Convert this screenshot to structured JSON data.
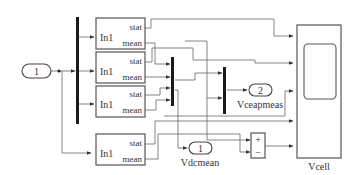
{
  "diagram": {
    "type": "simulink-block-diagram",
    "inport": {
      "number": "1"
    },
    "stat_blocks": [
      {
        "input": "In1",
        "out1": "stat",
        "out2": "mean"
      },
      {
        "input": "In1",
        "out1": "stat",
        "out2": "mean"
      },
      {
        "input": "In1",
        "out1": "stat",
        "out2": "mean"
      },
      {
        "input": "In1",
        "out1": "stat",
        "out2": "mean"
      }
    ],
    "outport_vcap": {
      "number": "2",
      "name": "Vceapmeas"
    },
    "outport_vdc": {
      "number": "1",
      "name": "Vdcmean"
    },
    "sum_block": {
      "plus": "+",
      "minus": "−"
    },
    "scope": {
      "name": "Vcell"
    }
  }
}
